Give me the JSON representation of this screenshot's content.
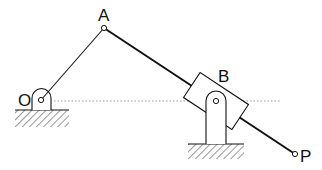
{
  "diagram": {
    "type": "mechanism",
    "labels": {
      "O": "O",
      "A": "A",
      "B": "B",
      "P": "P"
    },
    "points": {
      "O": [
        41,
        100
      ],
      "A": [
        104,
        28
      ],
      "B": [
        216,
        101
      ],
      "P": [
        295,
        154
      ]
    },
    "colors": {
      "line": "#111111",
      "dotted": "#999999",
      "background": "#ffffff"
    }
  }
}
